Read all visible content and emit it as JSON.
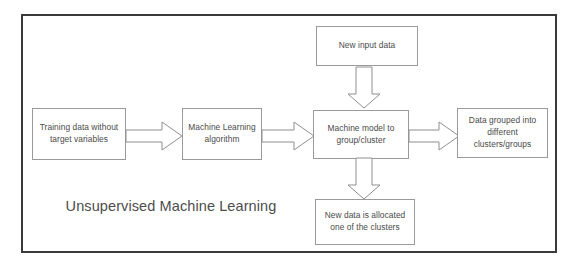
{
  "diagram": {
    "title": "Unsupervised Machine Learning",
    "frame_color": "#3a3a3a",
    "box_border_color": "#9a9a9a",
    "arrow_stroke_color": "#8f8f8f",
    "background_color": "#ffffff",
    "text_color": "#4a4a4a",
    "nodes": [
      {
        "id": "training-data",
        "label": "Training data without target variables"
      },
      {
        "id": "ml-algorithm",
        "label": "Machine Learning algorithm"
      },
      {
        "id": "new-input-data",
        "label": "New input data"
      },
      {
        "id": "machine-model",
        "label": "Machine model to group/cluster"
      },
      {
        "id": "data-grouped",
        "label": "Data grouped into different clusters/groups"
      },
      {
        "id": "new-data-allocated",
        "label": "New data is allocated one of the clusters"
      }
    ],
    "arrows": [
      {
        "id": "training-to-algorithm",
        "direction": "right"
      },
      {
        "id": "algorithm-to-model",
        "direction": "right"
      },
      {
        "id": "input-to-model",
        "direction": "down"
      },
      {
        "id": "model-to-grouped",
        "direction": "right"
      },
      {
        "id": "model-to-allocated",
        "direction": "down"
      }
    ]
  }
}
